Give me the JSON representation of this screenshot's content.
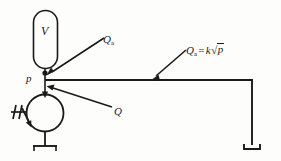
{
  "figure": {
    "stroke_color": "#1a1a1a",
    "background_color": "#fdfdfb",
    "labels": {
      "vessel_volume": "V",
      "pressure_node": "p",
      "flow_vessel": "Q",
      "flow_vessel_sub": "a",
      "flow_pump": "Q",
      "flow_orifice": "Q",
      "flow_orifice_sub": "a",
      "equals": "=",
      "gain": "k",
      "radical_symbol": "√",
      "radical_argument": "p"
    },
    "components": [
      {
        "name": "vessel",
        "shape": "stadium",
        "label": "V"
      },
      {
        "name": "pump",
        "shape": "circle",
        "label": ""
      },
      {
        "name": "motor-drive",
        "shape": "hatched-arrow",
        "label": ""
      },
      {
        "name": "pump-support",
        "shape": "ground",
        "label": ""
      },
      {
        "name": "orifice-support",
        "shape": "ground",
        "label": ""
      },
      {
        "name": "pressure-node",
        "shape": "dot",
        "label": "p"
      }
    ],
    "flows": [
      {
        "name": "vessel-flow",
        "label": "Qa",
        "direction": "into-node"
      },
      {
        "name": "pump-flow",
        "label": "Q",
        "direction": "into-node"
      },
      {
        "name": "orifice-flow",
        "label": "Qa = k√p",
        "direction": "out-of-node"
      }
    ]
  }
}
